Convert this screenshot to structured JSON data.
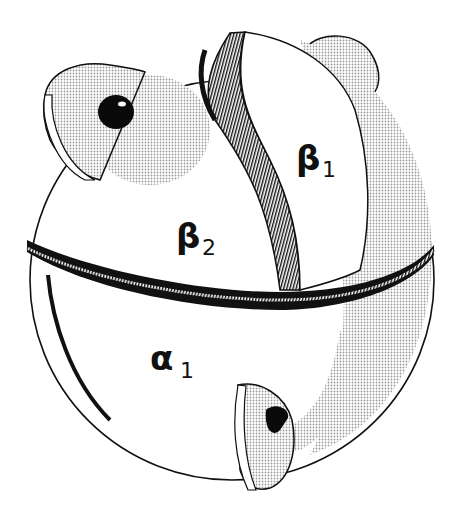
{
  "diagram": {
    "title": "",
    "subunits": [
      {
        "id": "beta1",
        "label": "β",
        "subscript": "1",
        "x": 296,
        "y": 170
      },
      {
        "id": "beta2",
        "label": "β",
        "subscript": "2",
        "x": 176,
        "y": 248
      },
      {
        "id": "alpha1",
        "label": "α",
        "subscript": "1",
        "x": 150,
        "y": 370
      }
    ],
    "heme_groups": 2,
    "colors": {
      "outline": "#111111",
      "fill": "#ffffff",
      "stipple": "#cfcfcf"
    }
  }
}
